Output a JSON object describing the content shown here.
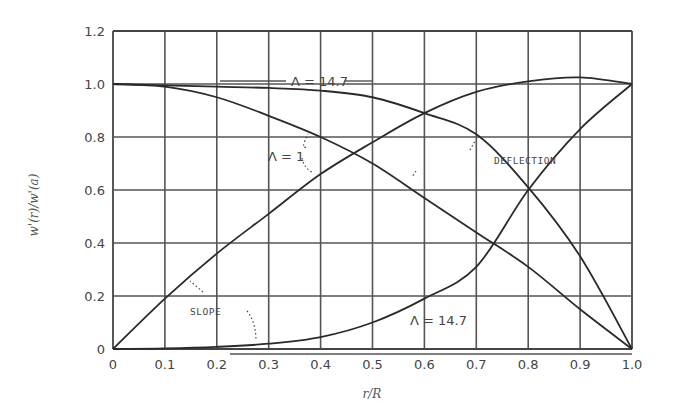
{
  "chart_data": {
    "type": "line",
    "title": "",
    "xlabel": "r/R",
    "ylabel": "w'(r)/w'(a)",
    "xlim": [
      0,
      1.0
    ],
    "ylim": [
      0,
      1.2
    ],
    "grid": true,
    "legend": "none (inline annotations)",
    "x_ticks": [
      "0",
      "0.1",
      "0.2",
      "0.3",
      "0.4",
      "0.5",
      "0.6",
      "0.7",
      "0.8",
      "0.9",
      "1.0"
    ],
    "y_ticks": [
      "0",
      "0.2",
      "0.4",
      "0.6",
      "0.8",
      "1.0",
      "1.2"
    ],
    "x": [
      0,
      0.1,
      0.2,
      0.3,
      0.4,
      0.5,
      0.6,
      0.7,
      0.8,
      0.9,
      1.0
    ],
    "series": [
      {
        "name": "Deflection, Λ = 1",
        "values": [
          1.0,
          0.99,
          0.95,
          0.88,
          0.8,
          0.7,
          0.57,
          0.44,
          0.31,
          0.15,
          0.0
        ]
      },
      {
        "name": "Deflection, Λ = 14.7",
        "values": [
          1.0,
          0.995,
          0.99,
          0.985,
          0.975,
          0.95,
          0.89,
          0.81,
          0.61,
          0.35,
          0.0
        ]
      },
      {
        "name": "Slope, Λ = 1",
        "values": [
          0.0,
          0.19,
          0.36,
          0.51,
          0.66,
          0.78,
          0.89,
          0.97,
          1.01,
          1.025,
          1.0
        ]
      },
      {
        "name": "Slope, Λ = 14.7",
        "values": [
          0.0,
          0.002,
          0.008,
          0.02,
          0.045,
          0.1,
          0.19,
          0.31,
          0.6,
          0.83,
          1.0
        ]
      }
    ],
    "annotations": [
      {
        "text": "Λ = 14.7",
        "target": "Deflection, Λ = 14.7",
        "position": "top, near x=0.35–0.55"
      },
      {
        "text": "Λ = 1",
        "target": "Deflection and Slope, Λ = 1",
        "position": "near x=0.35, y≈0.75"
      },
      {
        "text": "DEFLECTION",
        "position": "near x=0.6, y≈0.68"
      },
      {
        "text": "SLOPE",
        "position": "near x=0.2, y≈0.16"
      },
      {
        "text": "Λ = 14.7",
        "target": "Slope, Λ = 14.7",
        "position": "near x=0.6, y≈0.12"
      }
    ]
  },
  "labels": {
    "ylabel": "w'(r)/w'(a)",
    "xlabel": "r/R",
    "lambda_high_top": "Λ = 14.7",
    "lambda_one": "Λ = 1",
    "deflection": "DEFLECTION",
    "slope": "SLOPE",
    "lambda_high_bottom": "Λ = 14.7"
  }
}
